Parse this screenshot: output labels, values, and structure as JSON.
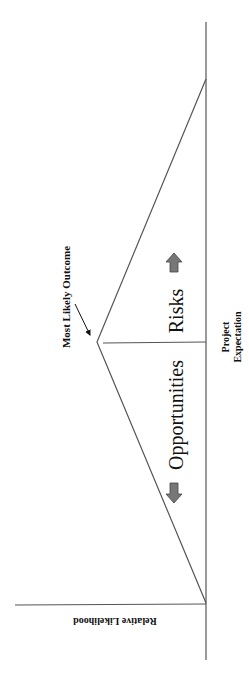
{
  "diagram": {
    "orientation": "rotated 90 degrees clockwise",
    "labels": {
      "most_likely": "Most Likely Outcome",
      "opportunities": "Opportunities",
      "risks": "Risks",
      "project_expectation_line1": "Project",
      "project_expectation_line2": "Expectation",
      "y_axis": "Relative Likelihood"
    },
    "colors": {
      "line": "#444444",
      "arrow_fill": "#777777",
      "text": "#111111"
    }
  }
}
